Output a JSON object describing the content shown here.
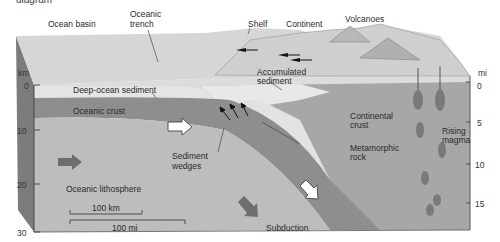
{
  "caption_fragment": "diagram",
  "labels": {
    "ocean_basin": "Ocean basin",
    "oceanic_trench_1": "Oceanic",
    "oceanic_trench_2": "trench",
    "shelf": "Shelf",
    "continent": "Continent",
    "volcanoes": "Volcanoes",
    "accumulated_sediment_1": "Accumulated",
    "accumulated_sediment_2": "sediment",
    "deep_ocean_sediment": "Deep-ocean sediment",
    "oceanic_crust": "Oceanic crust",
    "continental_crust_1": "Continental",
    "continental_crust_2": "crust",
    "rising_magma_1": "Rising",
    "rising_magma_2": "magma",
    "metamorphic_rock_1": "Metamorphic",
    "metamorphic_rock_2": "rock",
    "sediment_wedges_1": "Sediment",
    "sediment_wedges_2": "wedges",
    "oceanic_lithosphere": "Oceanic lithosphere",
    "subduction": "Subduction"
  },
  "left_axis": {
    "unit": "km",
    "ticks": [
      "0",
      "10",
      "20",
      "30"
    ]
  },
  "right_axis": {
    "unit": "mi",
    "ticks": [
      "0",
      "5",
      "10",
      "15"
    ]
  },
  "scale_bars": {
    "km": "100 km",
    "mi": "100 mi"
  },
  "colors": {
    "sea": "#d9d9d9",
    "sediment": "#e6e6e6",
    "crust": "#8e8e8e",
    "lithosphere": "#bdbdbd",
    "continental": "#a4a4a4",
    "arrow": "#6e6e6e",
    "magma": "#777777"
  }
}
